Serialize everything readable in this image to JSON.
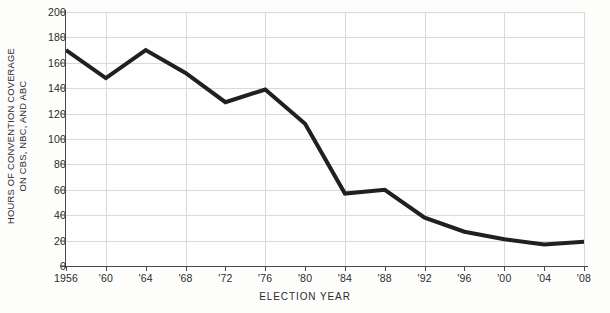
{
  "chart_data": {
    "type": "line",
    "title": "",
    "xlabel": "ELECTION YEAR",
    "ylabel": "HOURS OF CONVENTION COVERAGE ON CBS, NBC, AND ABC",
    "ylabel_line1": "HOURS OF CONVENTION COVERAGE",
    "ylabel_line2": "ON CBS, NBC, AND ABC",
    "categories": [
      "1956",
      "'60",
      "'64",
      "'68",
      "'72",
      "'76",
      "'80",
      "'84",
      "'88",
      "'92",
      "'96",
      "'00",
      "'04",
      "'08"
    ],
    "x_values": [
      1956,
      1960,
      1964,
      1968,
      1972,
      1976,
      1980,
      1984,
      1988,
      1992,
      1996,
      2000,
      2004,
      2008
    ],
    "values": [
      170,
      148,
      170,
      152,
      129,
      139,
      112,
      57,
      60,
      38,
      27,
      21,
      17,
      19
    ],
    "series": [
      {
        "name": "Hours of convention coverage",
        "values": [
          170,
          148,
          170,
          152,
          129,
          139,
          112,
          57,
          60,
          38,
          27,
          21,
          17,
          19
        ],
        "color": "#231f20"
      }
    ],
    "ylim": [
      0,
      200
    ],
    "xlim": [
      1956,
      2008
    ],
    "y_ticks": [
      0,
      20,
      40,
      60,
      80,
      100,
      120,
      140,
      160,
      180,
      200
    ],
    "y_tick_labels": [
      "0",
      "20",
      "40",
      "60",
      "80",
      "100",
      "120",
      "140",
      "160",
      "180",
      "200"
    ],
    "x_tick_labels": [
      "1956",
      "'60",
      "'64",
      "'68",
      "'72",
      "'76",
      "'80",
      "'84",
      "'88",
      "'92",
      "'96",
      "'00",
      "'04",
      "'08"
    ],
    "gridlines": {
      "horizontal": [
        20,
        40,
        60,
        80,
        100,
        120,
        140,
        160,
        180,
        200
      ],
      "vertical_years": [
        1960,
        1968,
        1976,
        1984,
        1992,
        2000,
        2008
      ]
    },
    "grid": true,
    "legend": "none",
    "colors": {
      "line": "#231f20",
      "grid": "#d9d9d9",
      "axis": "#4a4a4a",
      "text": "#2b2b2b",
      "background": "#fdfdfc"
    },
    "line_width": 4
  }
}
